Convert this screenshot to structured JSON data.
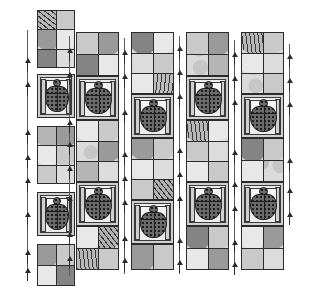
{
  "figure": {
    "canvas": {
      "width": 300,
      "height": 298,
      "background": "#ffffff"
    },
    "ink_color": "#2b2b2b",
    "palette": {
      "lightest": "#e8e8e8",
      "light": "#dcdcdc",
      "mid_light": "#c9c9c9",
      "mid": "#b5b5b5",
      "dark": "#9a9a9a",
      "darker": "#848484",
      "darkest": "#6e6e6e",
      "figure_fill": "#6a6a6a",
      "figure_dot": "#1c1c1c"
    },
    "hatch_names": [
      "horizontal-hatch",
      "vertical-hatch",
      "diagonal-hatch-right",
      "diagonal-hatch-left",
      "mottled-stipple",
      "dot-stipple"
    ]
  },
  "columns": [
    {
      "id": "column-1",
      "label": "left-segmented-column",
      "x": 37,
      "width": 38,
      "segmented": true,
      "blocks": [
        {
          "type": "chevron",
          "id": "c1-b1",
          "y": 10,
          "height": 58,
          "rows": 3,
          "fills": [
            [
              "h-horz",
              "f-m1"
            ],
            [
              "f-d1",
              "f-l1"
            ],
            [
              "f-d2",
              "f-l2"
            ]
          ]
        },
        {
          "type": "figure",
          "id": "c1-b2",
          "y": 74,
          "height": 44
        },
        {
          "type": "chevron",
          "id": "c1-b3",
          "y": 126,
          "height": 58,
          "rows": 3,
          "fills": [
            [
              "f-m2",
              "f-d1"
            ],
            [
              "f-l1",
              "f-m1"
            ],
            [
              "f-m1",
              "f-l2"
            ]
          ]
        },
        {
          "type": "figure",
          "id": "c1-b4",
          "y": 192,
          "height": 44
        },
        {
          "type": "chevron",
          "id": "c1-b5",
          "y": 244,
          "height": 42,
          "rows": 2,
          "fills": [
            [
              "f-d1",
              "f-m1"
            ],
            [
              "f-l1",
              "f-d2"
            ]
          ]
        }
      ]
    },
    {
      "id": "column-2",
      "label": "tall-column-a",
      "x": 76,
      "width": 43,
      "segmented": false,
      "y": 32,
      "height": 238,
      "blocks": [
        {
          "type": "chevron",
          "id": "c2-b1",
          "y": 0,
          "height": 44,
          "rows": 2,
          "fills": [
            [
              "f-m1",
              "f-d1"
            ],
            [
              "f-d2",
              "f-l1"
            ]
          ]
        },
        {
          "type": "figure",
          "id": "c2-b2",
          "y": 44,
          "height": 44
        },
        {
          "type": "chevron",
          "id": "c2-b3",
          "y": 88,
          "height": 62,
          "rows": 3,
          "fills": [
            [
              "f-l1",
              "f-m1"
            ],
            [
              "h-mott",
              "f-d1"
            ],
            [
              "f-m2",
              "f-l2"
            ]
          ]
        },
        {
          "type": "figure",
          "id": "c2-b4",
          "y": 150,
          "height": 44
        },
        {
          "type": "chevron",
          "id": "c2-b5",
          "y": 194,
          "height": 44,
          "rows": 2,
          "fills": [
            [
              "f-l1",
              "h-vert"
            ],
            [
              "h-diag",
              "f-m1"
            ]
          ]
        }
      ]
    },
    {
      "id": "column-3",
      "label": "tall-column-b",
      "x": 131,
      "width": 43,
      "segmented": false,
      "y": 32,
      "height": 238,
      "blocks": [
        {
          "type": "chevron",
          "id": "c3-b1",
          "y": 0,
          "height": 62,
          "rows": 3,
          "fills": [
            [
              "f-d2",
              "f-l1"
            ],
            [
              "f-l2",
              "f-m1"
            ],
            [
              "f-l1",
              "h-diag2"
            ]
          ]
        },
        {
          "type": "figure",
          "id": "c3-b2",
          "y": 62,
          "height": 44
        },
        {
          "type": "chevron",
          "id": "c3-b3",
          "y": 106,
          "height": 62,
          "rows": 3,
          "fills": [
            [
              "f-d1",
              "f-m1"
            ],
            [
              "f-l1",
              "f-l2"
            ],
            [
              "f-m1",
              "h-vert"
            ]
          ]
        },
        {
          "type": "figure",
          "id": "c3-b4",
          "y": 168,
          "height": 44
        },
        {
          "type": "chevron",
          "id": "c3-b5",
          "y": 212,
          "height": 26,
          "rows": 1,
          "fills": [
            [
              "f-d1",
              "f-m1"
            ]
          ]
        }
      ]
    },
    {
      "id": "column-4",
      "label": "tall-column-c",
      "x": 186,
      "width": 43,
      "segmented": false,
      "y": 32,
      "height": 238,
      "blocks": [
        {
          "type": "chevron",
          "id": "c4-b1",
          "y": 0,
          "height": 44,
          "rows": 2,
          "fills": [
            [
              "f-m1",
              "f-d1"
            ],
            [
              "h-mott",
              "f-m2"
            ]
          ]
        },
        {
          "type": "figure",
          "id": "c4-b2",
          "y": 44,
          "height": 44
        },
        {
          "type": "chevron",
          "id": "c4-b3",
          "y": 88,
          "height": 62,
          "rows": 3,
          "fills": [
            [
              "h-diag",
              "f-l1"
            ],
            [
              "f-m1",
              "f-l2"
            ],
            [
              "f-l1",
              "f-m1"
            ]
          ]
        },
        {
          "type": "figure",
          "id": "c4-b4",
          "y": 150,
          "height": 44
        },
        {
          "type": "chevron",
          "id": "c4-b5",
          "y": 194,
          "height": 44,
          "rows": 2,
          "fills": [
            [
              "f-d2",
              "f-m1"
            ],
            [
              "f-l1",
              "f-d1"
            ]
          ]
        }
      ]
    },
    {
      "id": "column-5",
      "label": "tall-column-d",
      "x": 241,
      "width": 43,
      "segmented": false,
      "y": 32,
      "height": 238,
      "blocks": [
        {
          "type": "chevron",
          "id": "c5-b1",
          "y": 0,
          "height": 62,
          "rows": 3,
          "fills": [
            [
              "h-diag",
              "f-m1"
            ],
            [
              "f-l1",
              "f-l2"
            ],
            [
              "h-mott",
              "f-m1"
            ]
          ]
        },
        {
          "type": "figure",
          "id": "c5-b2",
          "y": 62,
          "height": 44
        },
        {
          "type": "chevron",
          "id": "c5-b3",
          "y": 106,
          "height": 44,
          "rows": 2,
          "fills": [
            [
              "f-d2",
              "f-m1"
            ],
            [
              "f-l1",
              "h-mott"
            ]
          ]
        },
        {
          "type": "figure",
          "id": "c5-b4",
          "y": 150,
          "height": 44
        },
        {
          "type": "chevron",
          "id": "c5-b5",
          "y": 194,
          "height": 44,
          "rows": 2,
          "fills": [
            [
              "f-l1",
              "f-d1"
            ],
            [
              "f-m1",
              "f-l2"
            ]
          ]
        }
      ]
    }
  ],
  "tick_marks": {
    "label": "section-arrow-marks",
    "color": "#2b2b2b",
    "items": [
      {
        "x": 24,
        "y": 58,
        "dir": "up"
      },
      {
        "x": 24,
        "y": 82,
        "dir": "up"
      },
      {
        "x": 24,
        "y": 130,
        "dir": "up"
      },
      {
        "x": 24,
        "y": 155,
        "dir": "up"
      },
      {
        "x": 24,
        "y": 178,
        "dir": "up"
      },
      {
        "x": 24,
        "y": 212,
        "dir": "up"
      },
      {
        "x": 24,
        "y": 250,
        "dir": "up"
      },
      {
        "x": 24,
        "y": 268,
        "dir": "up"
      },
      {
        "x": 66,
        "y": 48,
        "dir": "up"
      },
      {
        "x": 66,
        "y": 72,
        "dir": "up"
      },
      {
        "x": 66,
        "y": 120,
        "dir": "up"
      },
      {
        "x": 66,
        "y": 142,
        "dir": "up"
      },
      {
        "x": 66,
        "y": 166,
        "dir": "up"
      },
      {
        "x": 66,
        "y": 196,
        "dir": "up"
      },
      {
        "x": 66,
        "y": 232,
        "dir": "up"
      },
      {
        "x": 66,
        "y": 256,
        "dir": "up"
      },
      {
        "x": 121,
        "y": 50,
        "dir": "up"
      },
      {
        "x": 121,
        "y": 74,
        "dir": "up"
      },
      {
        "x": 121,
        "y": 110,
        "dir": "up"
      },
      {
        "x": 121,
        "y": 152,
        "dir": "up"
      },
      {
        "x": 121,
        "y": 176,
        "dir": "up"
      },
      {
        "x": 121,
        "y": 200,
        "dir": "up"
      },
      {
        "x": 121,
        "y": 236,
        "dir": "up"
      },
      {
        "x": 121,
        "y": 258,
        "dir": "up"
      },
      {
        "x": 176,
        "y": 46,
        "dir": "up"
      },
      {
        "x": 176,
        "y": 70,
        "dir": "up"
      },
      {
        "x": 176,
        "y": 94,
        "dir": "up"
      },
      {
        "x": 176,
        "y": 148,
        "dir": "up"
      },
      {
        "x": 176,
        "y": 172,
        "dir": "up"
      },
      {
        "x": 176,
        "y": 196,
        "dir": "up"
      },
      {
        "x": 176,
        "y": 238,
        "dir": "up"
      },
      {
        "x": 176,
        "y": 260,
        "dir": "up"
      },
      {
        "x": 231,
        "y": 52,
        "dir": "up"
      },
      {
        "x": 231,
        "y": 76,
        "dir": "up"
      },
      {
        "x": 231,
        "y": 100,
        "dir": "up"
      },
      {
        "x": 231,
        "y": 150,
        "dir": "up"
      },
      {
        "x": 231,
        "y": 182,
        "dir": "up"
      },
      {
        "x": 231,
        "y": 206,
        "dir": "up"
      },
      {
        "x": 231,
        "y": 240,
        "dir": "up"
      },
      {
        "x": 231,
        "y": 262,
        "dir": "up"
      },
      {
        "x": 286,
        "y": 54,
        "dir": "up"
      },
      {
        "x": 286,
        "y": 78,
        "dir": "up"
      },
      {
        "x": 286,
        "y": 102,
        "dir": "up"
      },
      {
        "x": 286,
        "y": 158,
        "dir": "up"
      },
      {
        "x": 286,
        "y": 188,
        "dir": "up"
      },
      {
        "x": 286,
        "y": 212,
        "dir": "up"
      }
    ]
  },
  "dashed_guides": [
    {
      "x": 27,
      "y": 30,
      "height": 250
    },
    {
      "x": 69,
      "y": 36,
      "height": 240
    },
    {
      "x": 124,
      "y": 38,
      "height": 236
    },
    {
      "x": 179,
      "y": 36,
      "height": 238
    },
    {
      "x": 234,
      "y": 40,
      "height": 234
    },
    {
      "x": 289,
      "y": 44,
      "height": 180
    }
  ]
}
